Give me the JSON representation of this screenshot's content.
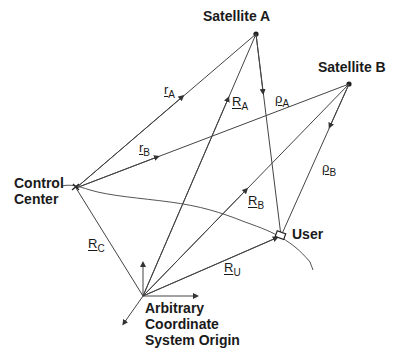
{
  "nodes": {
    "satellite_a": "Satellite A",
    "satellite_b": "Satellite B",
    "control_center": "Control\nCenter",
    "user": "User",
    "origin": "Arbitrary\nCoordinate\nSystem Origin"
  },
  "vectors": {
    "r_a": {
      "base": "r",
      "sub": "A"
    },
    "r_b": {
      "base": "r",
      "sub": "B"
    },
    "R_a": {
      "base": "R",
      "sub": "A"
    },
    "R_b": {
      "base": "R",
      "sub": "B"
    },
    "R_c": {
      "base": "R",
      "sub": "C"
    },
    "R_u": {
      "base": "R",
      "sub": "U"
    },
    "rho_a": {
      "base": "ρ",
      "sub": "A"
    },
    "rho_b": {
      "base": "ρ",
      "sub": "B"
    }
  },
  "colors": {
    "line": "#333333",
    "text": "#1a1a1a"
  }
}
